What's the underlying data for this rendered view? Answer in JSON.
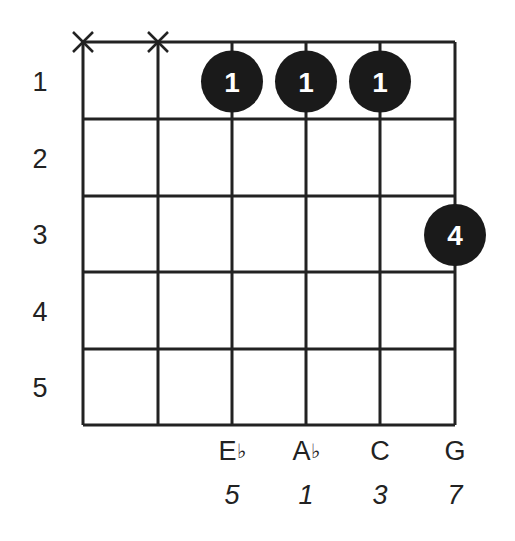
{
  "chord_diagram": {
    "strings_x": [
      83,
      158,
      232,
      306,
      380,
      455
    ],
    "frets_y": [
      42,
      119,
      196,
      272,
      349,
      425
    ],
    "fret_numbers": [
      "1",
      "2",
      "3",
      "4",
      "5"
    ],
    "muted_strings": [
      0,
      1
    ],
    "fingers": [
      {
        "string": 2,
        "fret": 1,
        "label": "1"
      },
      {
        "string": 3,
        "fret": 1,
        "label": "1"
      },
      {
        "string": 4,
        "fret": 1,
        "label": "1"
      },
      {
        "string": 5,
        "fret": 3,
        "label": "4"
      }
    ],
    "notes": [
      {
        "string": 2,
        "note": "E",
        "accidental": "♭",
        "interval": "5"
      },
      {
        "string": 3,
        "note": "A",
        "accidental": "♭",
        "interval": "1"
      },
      {
        "string": 4,
        "note": "C",
        "accidental": "",
        "interval": "3"
      },
      {
        "string": 5,
        "note": "G",
        "accidental": "",
        "interval": "7"
      }
    ],
    "colors": {
      "line": "#222222",
      "dot": "#1a1a1a",
      "dot_text": "#ffffff"
    }
  }
}
